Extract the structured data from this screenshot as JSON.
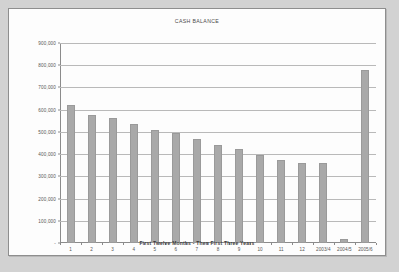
{
  "chart_data": {
    "type": "bar",
    "title": "CASH BALANCE",
    "xlabel": "First Twelve Months  -  Then First Three Years",
    "ylabel": "",
    "categories": [
      "1",
      "2",
      "3",
      "4",
      "5",
      "6",
      "7",
      "8",
      "9",
      "10",
      "11",
      "12",
      "2003/4",
      "2004/5",
      "2005/6"
    ],
    "values": [
      622000,
      578000,
      563000,
      537000,
      508000,
      497000,
      467000,
      440000,
      424000,
      397000,
      375000,
      360000,
      360000,
      20000,
      778000
    ],
    "ylim": [
      0,
      900000
    ],
    "ytick_labels": [
      "900,000",
      "800,000",
      "700,000",
      "600,000",
      "500,000",
      "400,000",
      "300,000",
      "200,000",
      "100,000",
      "-"
    ],
    "ytick_values": [
      900000,
      800000,
      700000,
      600000,
      500000,
      400000,
      300000,
      200000,
      100000,
      0
    ],
    "grid": true,
    "legend": "none",
    "bar_color": "#a9a9a9",
    "gridline_color": "#b9b9b9",
    "axis_color": "#8b8b8b",
    "panel_background": "#fdfdfd",
    "page_background": "#d2d2d2"
  }
}
